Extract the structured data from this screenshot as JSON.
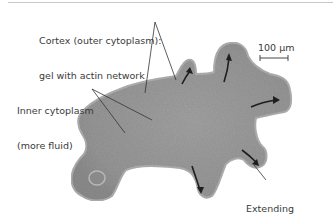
{
  "figure": {
    "labels": {
      "cortex": {
        "line1": "Cortex (outer cytoplasm):",
        "line2": "gel with actin network"
      },
      "inner": {
        "line1": "Inner cytoplasm",
        "line2": "(more fluid)"
      },
      "pseudopodium": {
        "line1": "Extending",
        "line2": "pseudopodium"
      }
    },
    "scale_bar": {
      "label": "100 µm"
    },
    "colors": {
      "cell_fill": "#9a9a9a",
      "cell_edge": "#b4b4b4",
      "arrow": "#1e1e1e",
      "leader_line": "#333333",
      "text": "#3a3a3a"
    }
  }
}
